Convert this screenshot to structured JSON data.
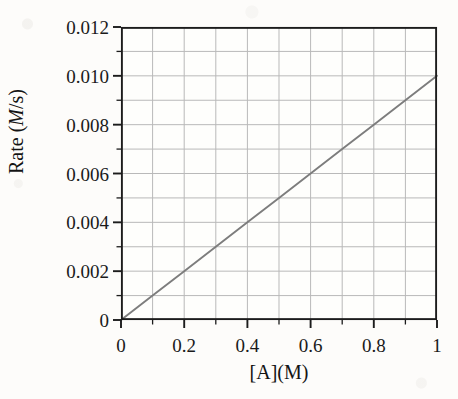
{
  "chart_data": {
    "type": "line",
    "title": "",
    "xlabel": "[A](M)",
    "ylabel": "Rate (M/s)",
    "ylabel_parts": {
      "prefix": "Rate (",
      "italic": "M",
      "suffix": "/s)"
    },
    "xlim": [
      0,
      1
    ],
    "ylim": [
      0,
      0.012
    ],
    "x_ticks": [
      0,
      0.2,
      0.4,
      0.6,
      0.8,
      1
    ],
    "x_tick_labels": [
      "0",
      "0.2",
      "0.4",
      "0.6",
      "0.8",
      "1"
    ],
    "y_ticks": [
      0,
      0.002,
      0.004,
      0.006,
      0.008,
      0.01,
      0.012
    ],
    "y_tick_labels": [
      "0",
      "0.002",
      "0.004",
      "0.006",
      "0.008",
      "0.010",
      "0.012"
    ],
    "x_gridline_step": 0.1,
    "y_gridline_step": 0.001,
    "grid": true,
    "legend": "none",
    "series": [
      {
        "name": "rate",
        "x": [
          0,
          0.1,
          0.2,
          0.3,
          0.4,
          0.5,
          0.6,
          0.7,
          0.8,
          0.9,
          1
        ],
        "values": [
          0,
          0.001,
          0.002,
          0.003,
          0.004,
          0.005,
          0.006,
          0.007,
          0.008,
          0.009,
          0.01
        ],
        "slope": 0.01,
        "intercept": 0,
        "color": "#7d7d7d"
      }
    ]
  },
  "style": {
    "background_color": "#fdfcfa",
    "frame_color": "#1c1c1c",
    "gridline_color": "#b9b9b9",
    "text_color": "#141414",
    "line_color": "#7d7d7d"
  }
}
